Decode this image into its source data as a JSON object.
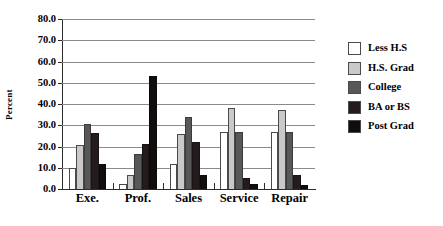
{
  "chart_data": {
    "type": "bar",
    "title": "",
    "subtitle": "",
    "xlabel": "",
    "ylabel": "Percent",
    "ylim": [
      0,
      80
    ],
    "ytick_step": 10,
    "ytick_labels": [
      "0.0",
      "10.0",
      "20.0",
      "30.0",
      "40.0",
      "50.0",
      "60.0",
      "70.0",
      "80.0"
    ],
    "grid": true,
    "legend_position": "right",
    "categories": [
      "Exe.",
      "Prof.",
      "Sales",
      "Service",
      "Repair"
    ],
    "series": [
      {
        "name": "Less H.S",
        "color": "#ffffff",
        "values": [
          10.0,
          2.5,
          11.8,
          27.0,
          26.8
        ]
      },
      {
        "name": "H.S. Grad",
        "color": "#c9c9c9",
        "values": [
          20.8,
          6.5,
          25.8,
          38.2,
          37.0
        ]
      },
      {
        "name": "College",
        "color": "#585858",
        "values": [
          30.6,
          16.3,
          33.9,
          26.8,
          26.8
        ]
      },
      {
        "name": "BA or BS",
        "color": "#241c1c",
        "values": [
          26.5,
          21.3,
          22.0,
          5.4,
          6.5
        ]
      },
      {
        "name": "Post Grad",
        "color": "#120d0d",
        "values": [
          11.6,
          53.4,
          6.4,
          2.3,
          1.8
        ]
      }
    ]
  }
}
